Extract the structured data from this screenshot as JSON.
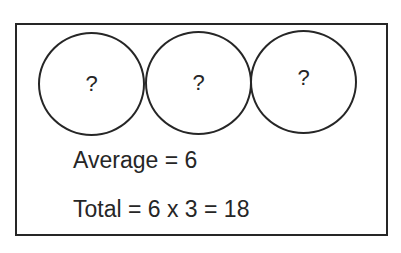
{
  "diagram": {
    "circles": [
      {
        "label": "?"
      },
      {
        "label": "?"
      },
      {
        "label": "?"
      }
    ],
    "average_text": "Average = 6",
    "total_text": "Total = 6 x 3 = 18"
  },
  "colors": {
    "stroke": "#262626",
    "text": "#262626",
    "background": "#ffffff"
  }
}
